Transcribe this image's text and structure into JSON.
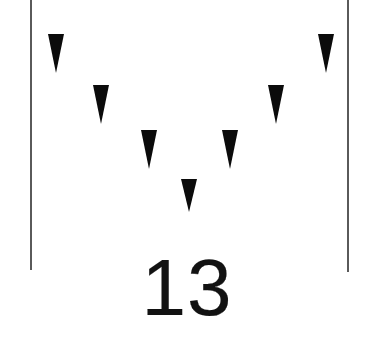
{
  "figure": {
    "caption": "13",
    "background_color": "#ffffff",
    "marker_color": "#0b0b0b",
    "rule_color": "#5a5a5a",
    "width": 374,
    "height": 337
  },
  "rules": [
    {
      "name": "left-rule",
      "x": 30,
      "y": 0,
      "height": 270,
      "thickness": 2
    },
    {
      "name": "right-rule",
      "x": 347,
      "y": 0,
      "height": 272,
      "thickness": 2
    }
  ],
  "markers": [
    {
      "index": 1,
      "center_x": 56,
      "top_y": 34,
      "width": 17,
      "height": 39,
      "label": "marker-1"
    },
    {
      "index": 2,
      "center_x": 101,
      "top_y": 85,
      "width": 17,
      "height": 39,
      "label": "marker-2"
    },
    {
      "index": 3,
      "center_x": 149,
      "top_y": 130,
      "width": 17,
      "height": 39,
      "label": "marker-3"
    },
    {
      "index": 4,
      "center_x": 189,
      "top_y": 179,
      "width": 17,
      "height": 33,
      "label": "marker-4"
    },
    {
      "index": 5,
      "center_x": 230,
      "top_y": 130,
      "width": 17,
      "height": 39,
      "label": "marker-5"
    },
    {
      "index": 6,
      "center_x": 276,
      "top_y": 85,
      "width": 17,
      "height": 39,
      "label": "marker-6"
    },
    {
      "index": 7,
      "center_x": 326,
      "top_y": 34,
      "width": 17,
      "height": 39,
      "label": "marker-7"
    }
  ],
  "chart_data": {
    "type": "scatter",
    "title": "13",
    "xlabel": "",
    "ylabel": "",
    "x": [
      56,
      101,
      149,
      189,
      230,
      276,
      326
    ],
    "values": [
      34,
      85,
      130,
      179,
      130,
      85,
      34
    ],
    "categories": [
      "1",
      "2",
      "3",
      "4",
      "5",
      "6",
      "7"
    ],
    "series": [
      {
        "name": "down-triangle-markers",
        "values": [
          34,
          85,
          130,
          179,
          130,
          85,
          34
        ]
      }
    ],
    "marker_shape": "triangle-down",
    "grid": false,
    "legend": "none",
    "xlim": [
      30,
      347
    ],
    "ylim": [
      0,
      270
    ],
    "annotations": [
      "13"
    ]
  }
}
